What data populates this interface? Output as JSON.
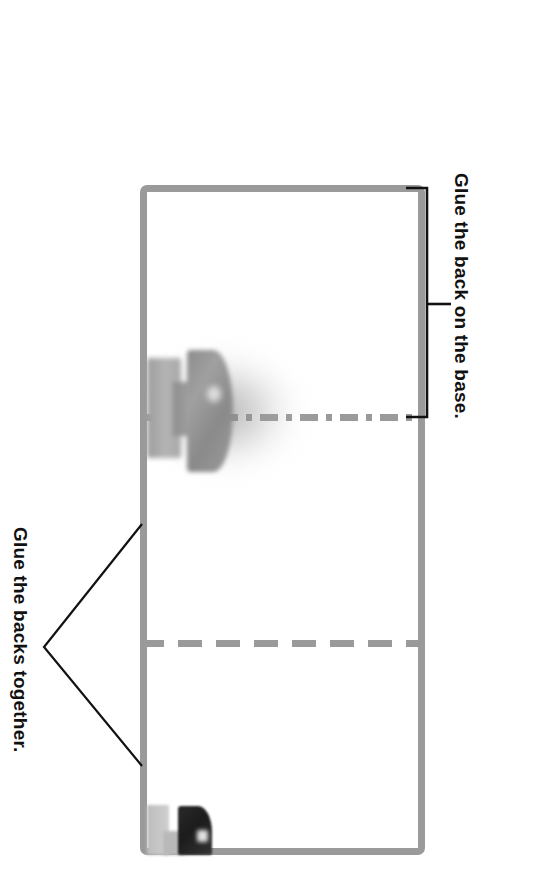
{
  "page": {
    "background_color": "#ffffff",
    "width": 534,
    "height": 880
  },
  "diagram": {
    "sheet": {
      "name": "template-sheet",
      "outline_color": "#9a9a9a",
      "fill_color": "#ffffff",
      "corner_radius_px": 7,
      "border_width_px": 7
    },
    "fold_lines": [
      {
        "name": "center-dash-dot-line",
        "style": "dash-dot",
        "color": "#9a9a9a",
        "orientation": "horizontal"
      },
      {
        "name": "lower-dashed-fold-line",
        "style": "dashed",
        "color": "#9a9a9a",
        "orientation": "horizontal"
      }
    ],
    "photos": [
      {
        "name": "blurred-product-upper",
        "description": "blurred grey product with soft radial halo",
        "tone": "grey"
      },
      {
        "name": "blurred-product-lower",
        "description": "small dark product with pale block beside it",
        "tone": "dark"
      }
    ],
    "callouts": [
      {
        "id": "back-on-base",
        "label": "Glue the back on the base.",
        "bracket": "square-bracket-right",
        "text_color": "#111111",
        "rotation_deg": 90
      },
      {
        "id": "backs-together",
        "label": "Glue the backs together.",
        "bracket": "v-bracket-left",
        "text_color": "#111111",
        "rotation_deg": 90
      }
    ]
  }
}
